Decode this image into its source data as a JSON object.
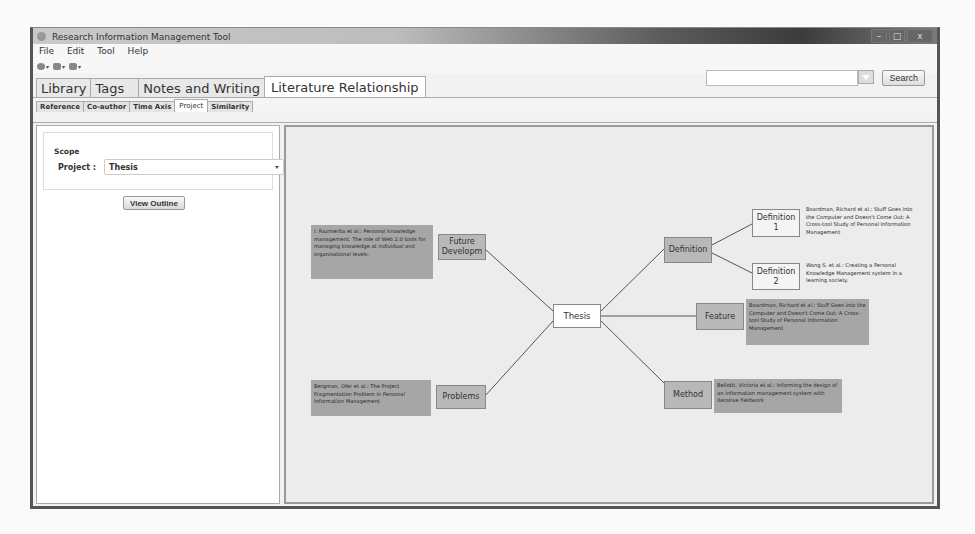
{
  "window": {
    "title": "Research Information Management Tool",
    "controls": {
      "minimize": "–",
      "maximize": "□",
      "close": "x"
    }
  },
  "menubar": {
    "items": [
      "File",
      "Edit",
      "Tool",
      "Help"
    ]
  },
  "toolbar": {
    "buttons": [
      {
        "icon": "back-icon",
        "dropdown": "▾"
      },
      {
        "icon": "forward-icon",
        "dropdown": "▾"
      },
      {
        "icon": "folder-icon",
        "dropdown": "▾"
      }
    ]
  },
  "search": {
    "value": "",
    "placeholder": "",
    "button_label": "Search"
  },
  "main_tabs": [
    {
      "label": "Library",
      "active": false
    },
    {
      "label": "Tags",
      "active": false
    },
    {
      "label": "Notes and Writing",
      "active": false
    },
    {
      "label": "Literature Relationship",
      "active": true
    }
  ],
  "sub_tabs": [
    {
      "label": "Reference",
      "active": false
    },
    {
      "label": "Co-author",
      "active": false
    },
    {
      "label": "Time Axis",
      "active": false
    },
    {
      "label": "Project",
      "active": true
    },
    {
      "label": "Similarity",
      "active": false
    }
  ],
  "scope": {
    "title": "Scope",
    "project_label": "Project :",
    "project_value": "Thesis",
    "view_outline_label": "View Outline"
  },
  "mindmap": {
    "center": {
      "label": "Thesis"
    },
    "branches": {
      "future": {
        "label": "Future Developm",
        "note": "I. Razmerita et al.: Personal knowledge management: The role of Web 2.0 tools for managing knowledge at individual and organisational levels."
      },
      "problems": {
        "label": "Problems",
        "note": "Bergman, Ofer et al.: The Project Fragmentation Problem in Personal Information Management"
      },
      "definition": {
        "label": "Definition"
      },
      "definition1": {
        "label": "Definition 1",
        "note": "Boardman, Richard et al.: Stuff Goes into the Computer and Doesn't Come Out: A Cross-tool Study of Personal Information Management"
      },
      "definition2": {
        "label": "Definition 2",
        "note": "Wang S. et al.: Creating a Personal Knowledge Management system in a learning society."
      },
      "feature": {
        "label": "Feature",
        "note": "Boardman, Richard et al.: Stuff Goes into the Computer and Doesn't Come Out: A Cross-tool Study of Personal Information Management"
      },
      "method": {
        "label": "Method",
        "note": "Bellotti, Victoria et al.: Informing the design of an information management system with iterative fieldwork"
      }
    }
  }
}
